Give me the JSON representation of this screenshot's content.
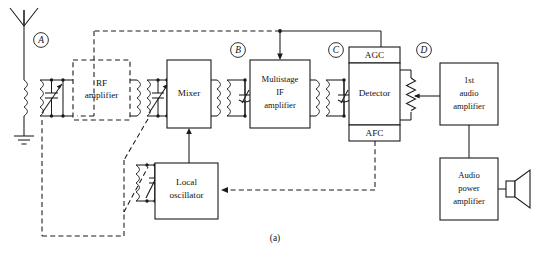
{
  "figure": {
    "caption": "(a)"
  },
  "test_points": [
    {
      "id": "A",
      "label": "A"
    },
    {
      "id": "B",
      "label": "B"
    },
    {
      "id": "C",
      "label": "C"
    },
    {
      "id": "D",
      "label": "D"
    }
  ],
  "blocks": {
    "rf_amplifier": {
      "line1": "RF",
      "line2": "amplifier",
      "style": "dashed"
    },
    "mixer": {
      "line1": "Mixer",
      "style": "solid"
    },
    "if_amplifier": {
      "line1": "Multistage",
      "line2": "IF",
      "line3": "amplifier",
      "style": "solid"
    },
    "detector": {
      "line1": "Detector",
      "style": "solid"
    },
    "agc": {
      "line1": "AGC",
      "style": "solid"
    },
    "afc": {
      "line1": "AFC",
      "style": "solid"
    },
    "local_oscillator": {
      "line1": "Local",
      "line2": "oscillator",
      "style": "solid"
    },
    "first_audio_amplifier": {
      "line1": "1st",
      "line2": "audio",
      "line3": "amplifier",
      "style": "solid"
    },
    "audio_power_amplifier": {
      "line1": "Audio",
      "line2": "power",
      "line3": "amplifier",
      "style": "solid"
    }
  },
  "components": {
    "antenna": "antenna",
    "ground": "ground",
    "speaker": "loudspeaker",
    "volume_control": "potentiometer",
    "variable_capacitors": 3,
    "transformers": 5,
    "ganged_tuning": "dashed mechanical linkage"
  },
  "colors": {
    "line": "#1a1a1a",
    "background": "#ffffff",
    "text": "#111111"
  }
}
